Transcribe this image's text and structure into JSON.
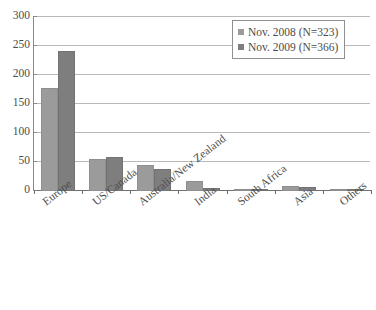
{
  "chart_data": {
    "type": "bar",
    "title": "",
    "subtitle": "",
    "xlabel": "",
    "ylabel": "",
    "ylim": [
      0,
      300
    ],
    "yticks": [
      0,
      50,
      100,
      150,
      200,
      250,
      300
    ],
    "grid": true,
    "legend_position": "top-right",
    "categories": [
      "Europe",
      "US/Canada",
      "Australia/New Zealand",
      "India",
      "South Africa",
      "Asia",
      "Others"
    ],
    "series": [
      {
        "name": "Nov. 2008 (N=323)",
        "color": "#9b9b9b",
        "values": [
          177,
          55,
          45,
          17,
          3,
          8,
          2
        ]
      },
      {
        "name": "Nov. 2009 (N=366)",
        "color": "#7e7e7e",
        "values": [
          240,
          58,
          37,
          5,
          3,
          6,
          1
        ]
      }
    ]
  },
  "legend": {
    "entries": [
      {
        "label": "Nov. 2008 (N=323)",
        "swatch_icon": "square-swatch-icon"
      },
      {
        "label": "Nov. 2009 (N=366)",
        "swatch_icon": "square-swatch-icon"
      }
    ]
  },
  "colors": {
    "series_2008": "#9b9b9b",
    "series_2009": "#7e7e7e",
    "gridline": "#b9b9b9",
    "axis": "#6f6f6f",
    "text": "#4c4c4c",
    "background": "#ffffff"
  }
}
